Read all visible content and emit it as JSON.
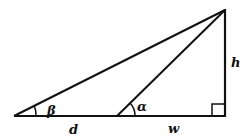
{
  "diagram": {
    "type": "right-triangle-angle-of-elevation",
    "stroke_color": "#111111",
    "background": "#ffffff",
    "points": {
      "left_vertex": {
        "x": 14,
        "y": 116
      },
      "middle_vertex": {
        "x": 117,
        "y": 116
      },
      "apex": {
        "x": 224,
        "y": 10
      },
      "right_angle_corner": {
        "x": 225,
        "y": 116
      }
    },
    "labels": {
      "beta": "β",
      "alpha": "α",
      "height": "h",
      "distance_d": "d",
      "distance_w": "w"
    },
    "angles": {
      "beta_at": "left_vertex",
      "alpha_at": "middle_vertex",
      "right_angle_at": "right_angle_corner"
    }
  }
}
